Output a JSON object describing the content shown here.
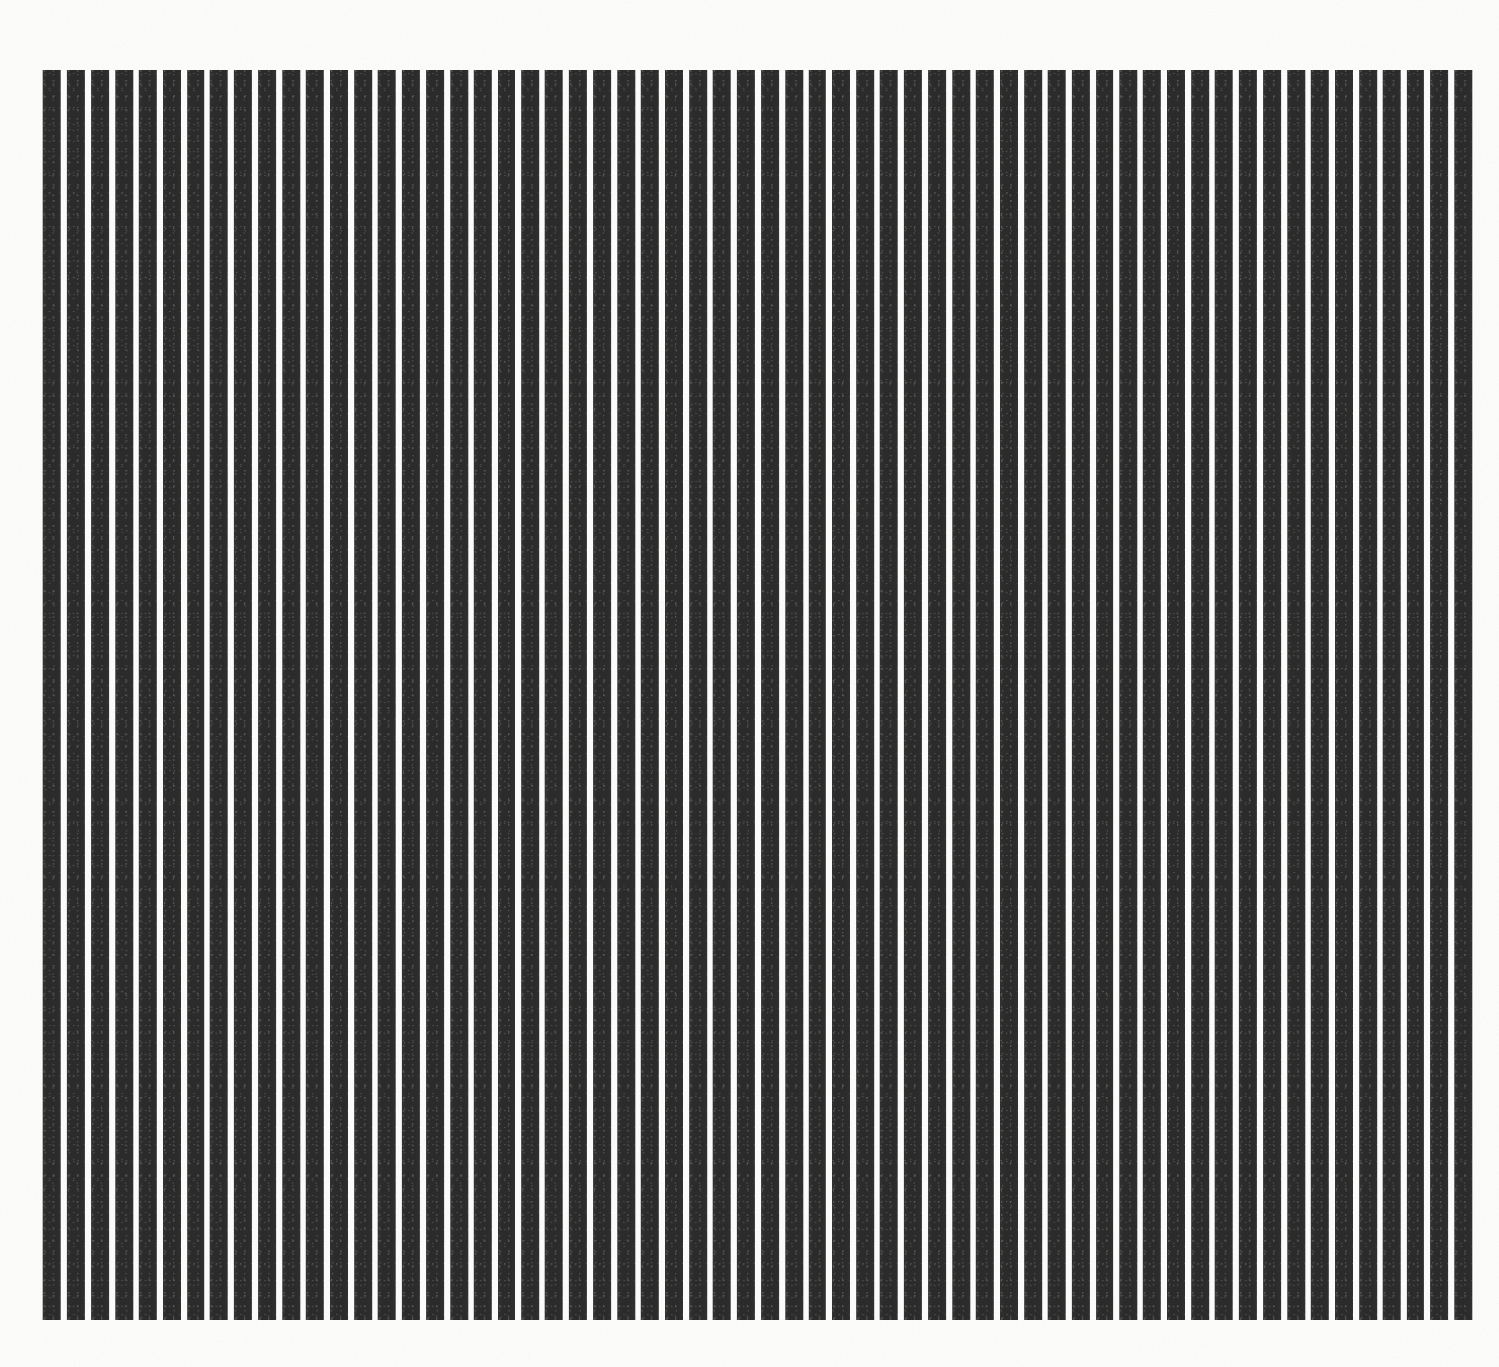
{
  "artwork": {
    "title": "Vertical Stripe Composition",
    "medium_note": "black vertical bars on off-white ground",
    "canvas": {
      "width_px": 1499,
      "height_px": 1367,
      "background_color": "#fdfdfc",
      "paper_tone": "#fbfaf8"
    },
    "stripe_field": {
      "left_px": 43,
      "top_px": 70,
      "right_px": 1472,
      "bottom_px": 1320,
      "width_px": 1429,
      "height_px": 1250,
      "stripe_count": 60,
      "stripe_color": "#2b2b2b",
      "gap_color": "#fdfdfc",
      "stripe_width_px": 18,
      "gap_width_px": 6,
      "period_px": 24,
      "orientation": "vertical",
      "alignment": "uniform-top-and-bottom",
      "edge_margins": {
        "top_px": 70,
        "bottom_px": 47,
        "left_px": 43,
        "right_px": 27
      }
    }
  },
  "chart_data": {
    "type": "bar",
    "subtitle": "",
    "xlabel": "",
    "ylabel": "",
    "grid": false,
    "legend": "none",
    "orientation": "vertical",
    "bar_color": "#2b2b2b",
    "background_color": "#fdfdfc",
    "bar_width_px": 18,
    "bar_gap_px": 6,
    "categories": [
      "1",
      "2",
      "3",
      "4",
      "5",
      "6",
      "7",
      "8",
      "9",
      "10",
      "11",
      "12",
      "13",
      "14",
      "15",
      "16",
      "17",
      "18",
      "19",
      "20",
      "21",
      "22",
      "23",
      "24",
      "25",
      "26",
      "27",
      "28",
      "29",
      "30",
      "31",
      "32",
      "33",
      "34",
      "35",
      "36",
      "37",
      "38",
      "39",
      "40",
      "41",
      "42",
      "43",
      "44",
      "45",
      "46",
      "47",
      "48",
      "49",
      "50",
      "51",
      "52",
      "53",
      "54",
      "55",
      "56",
      "57",
      "58",
      "59",
      "60"
    ],
    "values": [
      100,
      100,
      100,
      100,
      100,
      100,
      100,
      100,
      100,
      100,
      100,
      100,
      100,
      100,
      100,
      100,
      100,
      100,
      100,
      100,
      100,
      100,
      100,
      100,
      100,
      100,
      100,
      100,
      100,
      100,
      100,
      100,
      100,
      100,
      100,
      100,
      100,
      100,
      100,
      100,
      100,
      100,
      100,
      100,
      100,
      100,
      100,
      100,
      100,
      100,
      100,
      100,
      100,
      100,
      100,
      100,
      100,
      100,
      100,
      100
    ],
    "ylim": [
      0,
      100
    ],
    "tick_labels_x": [],
    "tick_labels_y": [],
    "annotations": []
  }
}
